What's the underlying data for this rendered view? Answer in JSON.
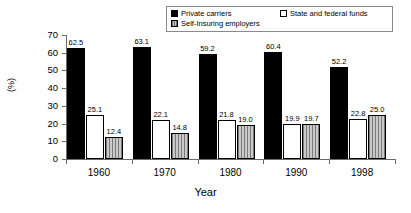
{
  "chart_data": {
    "type": "bar",
    "title": "",
    "xlabel": "Year",
    "ylabel": "(%)",
    "categories": [
      "1960",
      "1970",
      "1980",
      "1990",
      "1998"
    ],
    "series": [
      {
        "name": "Private carriers",
        "values": [
          62.5,
          63.1,
          59.2,
          60.4,
          52.2
        ],
        "style": "black"
      },
      {
        "name": "State and federal funds",
        "values": [
          25.1,
          22.1,
          21.8,
          19.9,
          22.8
        ],
        "style": "white"
      },
      {
        "name": "Self-Insuring employers",
        "values": [
          12.4,
          14.8,
          19.0,
          19.7,
          25.0
        ],
        "style": "hatched-gray"
      }
    ],
    "ylim": [
      0,
      70
    ],
    "yticks": [
      "0",
      "10",
      "20",
      "30",
      "40",
      "50",
      "60",
      "70"
    ],
    "grid": false,
    "legend_position": "top"
  },
  "legend": {
    "entries": [
      {
        "label": "Private carriers"
      },
      {
        "label": "Self-Insuring employers"
      },
      {
        "label": "State and federal funds"
      }
    ]
  },
  "colors": {
    "series_black": "#000000",
    "series_white": "#ffffff",
    "series_gray": "#b5b5b5",
    "axis": "#6b6b6b",
    "text": "#000000",
    "background": "#ffffff"
  }
}
